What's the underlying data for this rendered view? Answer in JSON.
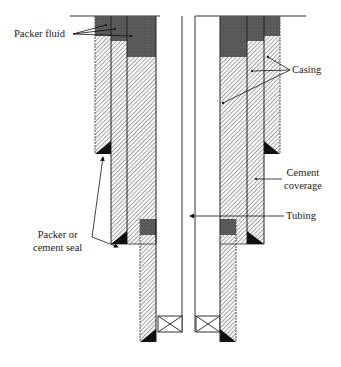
{
  "labels": {
    "packer_fluid": "Packer fluid",
    "casing": "Casing",
    "cement_line1": "Cement",
    "cement_line2": "coverage",
    "tubing": "Tubing",
    "seal_line1": "Packer or",
    "seal_line2": "cement seal"
  },
  "colors": {
    "packer_fluid": "#5a5a5a",
    "cement_hatch": "#8a8a8a",
    "seal": "#111111",
    "line": "#333333"
  }
}
